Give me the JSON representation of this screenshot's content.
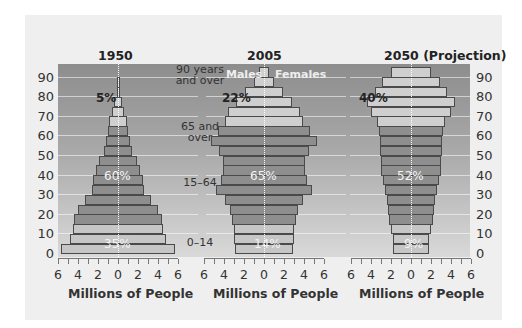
{
  "chart_data": {
    "type": "bar",
    "subtype": "population-pyramid",
    "title": "",
    "xlabel": "Millions of People",
    "ylabel": "Age",
    "x_ticks": [
      "6",
      "4",
      "2",
      "0",
      "2",
      "4",
      "6"
    ],
    "y_ticks": [
      "0",
      "10",
      "20",
      "30",
      "40",
      "50",
      "60",
      "70",
      "80",
      "90"
    ],
    "xlim": [
      -6,
      6
    ],
    "ylim": [
      0,
      95
    ],
    "grid": true,
    "categories": [
      "0-4",
      "5-9",
      "10-14",
      "15-19",
      "20-24",
      "25-29",
      "30-34",
      "35-39",
      "40-44",
      "45-49",
      "50-54",
      "55-59",
      "60-64",
      "65-69",
      "70-74",
      "75-79",
      "80-84",
      "85-89",
      "90+"
    ],
    "legend": {
      "left": "Males",
      "right": "Females"
    },
    "age_group_labels": [
      {
        "label": "0–14",
        "pos": "low"
      },
      {
        "label": "15–64",
        "pos": "mid"
      },
      {
        "label": "65 and\nover",
        "pos": "high"
      },
      {
        "label": "90 years\nand over",
        "pos": "top"
      }
    ],
    "panels": [
      {
        "title": "1950",
        "shares": {
          "0-14": "35%",
          "15-64": "60%",
          "65+": "5%"
        },
        "series": [
          {
            "name": "Males",
            "values": [
              5.7,
              4.8,
              4.5,
              4.4,
              4.0,
              3.3,
              2.6,
              2.5,
              2.2,
              1.9,
              1.4,
              1.2,
              1.0,
              0.9,
              0.6,
              0.4,
              0.1,
              0.05,
              0
            ]
          },
          {
            "name": "Females",
            "values": [
              5.7,
              4.8,
              4.5,
              4.4,
              4.0,
              3.3,
              2.6,
              2.5,
              2.2,
              1.9,
              1.4,
              1.2,
              1.0,
              0.9,
              0.6,
              0.4,
              0.1,
              0.05,
              0
            ]
          }
        ]
      },
      {
        "title": "2005",
        "shares": {
          "0-14": "14%",
          "15-64": "65%",
          "65+": "22%"
        },
        "series": [
          {
            "name": "Males",
            "values": [
              2.9,
              3.0,
              3.0,
              3.2,
              3.4,
              3.9,
              4.8,
              4.3,
              4.1,
              4.1,
              4.5,
              5.3,
              4.6,
              3.9,
              3.6,
              2.8,
              1.9,
              1.0,
              0.5
            ]
          },
          {
            "name": "Females",
            "values": [
              2.9,
              3.0,
              3.0,
              3.2,
              3.4,
              3.9,
              4.8,
              4.3,
              4.1,
              4.1,
              4.5,
              5.3,
              4.6,
              3.9,
              3.6,
              2.8,
              1.9,
              1.0,
              0.5
            ]
          }
        ]
      },
      {
        "title": "2050 (Projection)",
        "shares": {
          "0-14": "9%",
          "15-64": "52%",
          "65+": "40%"
        },
        "series": [
          {
            "name": "Males",
            "values": [
              1.8,
              1.8,
              2.0,
              2.2,
              2.3,
              2.4,
              2.6,
              2.8,
              3.0,
              3.0,
              3.1,
              3.1,
              3.2,
              3.4,
              4.0,
              4.4,
              3.6,
              2.9,
              2.0
            ]
          },
          {
            "name": "Females",
            "values": [
              1.8,
              1.8,
              2.0,
              2.2,
              2.3,
              2.4,
              2.6,
              2.8,
              3.0,
              3.0,
              3.1,
              3.1,
              3.2,
              3.4,
              4.0,
              4.4,
              3.6,
              2.9,
              2.0
            ]
          }
        ]
      }
    ]
  },
  "labels": {
    "panel_titles": [
      "1950",
      "2005",
      "2050 (Projection)"
    ],
    "xlabel": "Millions of People",
    "males": "Males",
    "females": "Females",
    "age_90": "90 years\nand over",
    "age_65": "65 and\nover",
    "age_15": "15–64",
    "age_0": "0–14",
    "p1950": {
      "old": "5%",
      "work": "60%",
      "young": "35%"
    },
    "p2005": {
      "old": "22%",
      "work": "65%",
      "young": "14%"
    },
    "p2050": {
      "old": "40%",
      "work": "52%",
      "young": "9%"
    }
  },
  "colors": {
    "young": "#c6c6c6",
    "working": "#8e8e8e",
    "old": "#cfcfcf",
    "background_top": "#8d8d8d",
    "background_bottom": "#d9d9d9"
  }
}
